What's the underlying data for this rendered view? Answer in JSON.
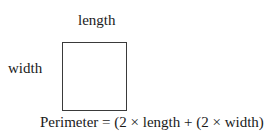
{
  "diagram": {
    "shape": "rectangle",
    "labels": {
      "top": "length",
      "left": "width"
    },
    "formula": "Perimeter = (2 × length + (2 × width)"
  }
}
